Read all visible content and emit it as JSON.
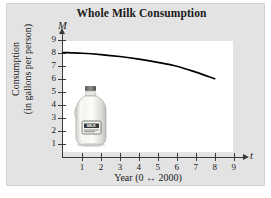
{
  "figure": {
    "title": "Whole Milk Consumption",
    "background_color": "#e3e3e3",
    "plot_background_color": "#ffffff",
    "axis_color": "#3a3a3a",
    "curve_color": "#000000"
  },
  "axes": {
    "y_variable": "M",
    "x_variable": "t",
    "y_title_line1": "Consumption",
    "y_title_line2": "(in gallons per person)",
    "x_title": "Year (0 ↔ 2000)"
  },
  "illustration": {
    "name": "milk-jug",
    "label_text": "MILK"
  },
  "chart_data": {
    "type": "line",
    "title": "Whole Milk Consumption",
    "xlabel": "Year (0 ↔ 2000)",
    "ylabel": "Consumption (in gallons per person)",
    "x_variable": "t",
    "y_variable": "M",
    "xlim": [
      0,
      9.6
    ],
    "ylim": [
      0,
      9.5
    ],
    "xticks": [
      1,
      2,
      3,
      4,
      5,
      6,
      7,
      8,
      9
    ],
    "xtick_labels": [
      "1",
      "2",
      "3",
      "4",
      "5",
      "6",
      "7",
      "8",
      "9"
    ],
    "yticks": [
      1,
      2,
      3,
      4,
      5,
      6,
      7,
      8,
      9
    ],
    "ytick_labels": [
      "1",
      "2",
      "3",
      "4",
      "5",
      "6",
      "7",
      "8",
      "9"
    ],
    "grid": false,
    "legend": false,
    "series": [
      {
        "name": "Whole milk consumption",
        "x": [
          0,
          1,
          2,
          3,
          4,
          5,
          6,
          7,
          8
        ],
        "values": [
          8.0,
          7.95,
          7.85,
          7.7,
          7.5,
          7.25,
          6.95,
          6.5,
          6.0
        ]
      }
    ]
  }
}
